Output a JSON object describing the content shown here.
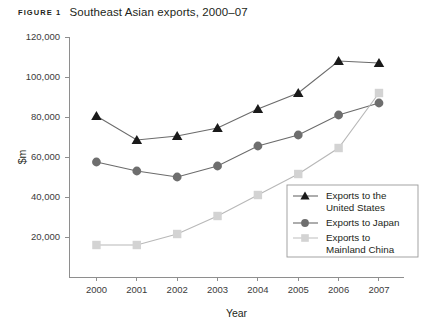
{
  "caption": {
    "figure_label": "FIGURE 1",
    "title": "Southeast Asian exports, 2000–07"
  },
  "axes": {
    "ylabel": "$m",
    "xlabel": "Year",
    "yticks": [
      "20,000",
      "40,000",
      "60,000",
      "80,000",
      "100,000",
      "120,000"
    ],
    "xticks": [
      "2000",
      "2001",
      "2002",
      "2003",
      "2004",
      "2005",
      "2006",
      "2007"
    ]
  },
  "legend": {
    "items": [
      {
        "label_line1": "Exports to the",
        "label_line2": "United States",
        "marker": "triangle-marker",
        "color": "#1a1a1a"
      },
      {
        "label_line1": "Exports to Japan",
        "label_line2": "",
        "marker": "circle-marker",
        "color": "#6e6e6e"
      },
      {
        "label_line1": "Exports to",
        "label_line2": "Mainland China",
        "marker": "square-marker",
        "color": "#d3d3d3"
      }
    ]
  },
  "chart_data": {
    "type": "line",
    "title": "Southeast Asian exports, 2000–07",
    "xlabel": "Year",
    "ylabel": "$m",
    "x": [
      2000,
      2001,
      2002,
      2003,
      2004,
      2005,
      2006,
      2007
    ],
    "categories": [
      "2000",
      "2001",
      "2002",
      "2003",
      "2004",
      "2005",
      "2006",
      "2007"
    ],
    "xlim": [
      2000,
      2007
    ],
    "ylim": [
      0,
      120000
    ],
    "ytick_values": [
      20000,
      40000,
      60000,
      80000,
      100000,
      120000
    ],
    "grid": false,
    "legend_position": "lower right inside",
    "series": [
      {
        "name": "Exports to the United States",
        "marker": "triangle",
        "color": "#1a1a1a",
        "values": [
          80500,
          68500,
          70500,
          74500,
          84000,
          92000,
          108000,
          107000
        ]
      },
      {
        "name": "Exports to Japan",
        "marker": "circle",
        "color": "#6e6e6e",
        "values": [
          57500,
          53000,
          50000,
          55500,
          65500,
          71000,
          81000,
          87000
        ]
      },
      {
        "name": "Exports to Mainland China",
        "marker": "square",
        "color": "#d3d3d3",
        "values": [
          16000,
          16000,
          21500,
          30500,
          41000,
          51500,
          64500,
          92000
        ]
      }
    ]
  }
}
